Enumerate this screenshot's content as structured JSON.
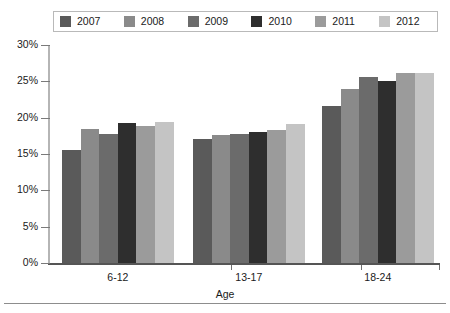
{
  "chart_data": {
    "type": "bar",
    "title": "",
    "subtitle": "",
    "xlabel": "Age",
    "ylabel": "",
    "categories": [
      "6-12",
      "13-17",
      "18-24"
    ],
    "series": [
      {
        "name": "2007",
        "color": "#5a5a5a",
        "values": [
          15.6,
          17.1,
          21.6
        ]
      },
      {
        "name": "2008",
        "color": "#8a8a8a",
        "values": [
          18.4,
          17.6,
          24.0
        ]
      },
      {
        "name": "2009",
        "color": "#6b6b6b",
        "values": [
          17.8,
          17.8,
          25.6
        ]
      },
      {
        "name": "2010",
        "color": "#2e2e2e",
        "values": [
          19.2,
          18.0,
          25.0
        ]
      },
      {
        "name": "2011",
        "color": "#9b9b9b",
        "values": [
          18.8,
          18.3,
          26.1
        ]
      },
      {
        "name": "2012",
        "color": "#c4c4c4",
        "values": [
          19.4,
          19.1,
          26.2
        ]
      }
    ],
    "ylim": [
      0,
      30
    ],
    "ytick_values": [
      0,
      5,
      10,
      15,
      20,
      25,
      30
    ],
    "ytick_labels": [
      "0%",
      "5%",
      "10%",
      "15%",
      "20%",
      "25%",
      "30%"
    ],
    "grid": false,
    "legend_position": "top"
  },
  "legend": {
    "items": [
      {
        "label": "2007",
        "color": "#5a5a5a"
      },
      {
        "label": "2008",
        "color": "#8a8a8a"
      },
      {
        "label": "2009",
        "color": "#6b6b6b"
      },
      {
        "label": "2010",
        "color": "#2e2e2e"
      },
      {
        "label": "2011",
        "color": "#9b9b9b"
      },
      {
        "label": "2012",
        "color": "#c4c4c4"
      }
    ]
  },
  "axis": {
    "x_title": "Age"
  }
}
